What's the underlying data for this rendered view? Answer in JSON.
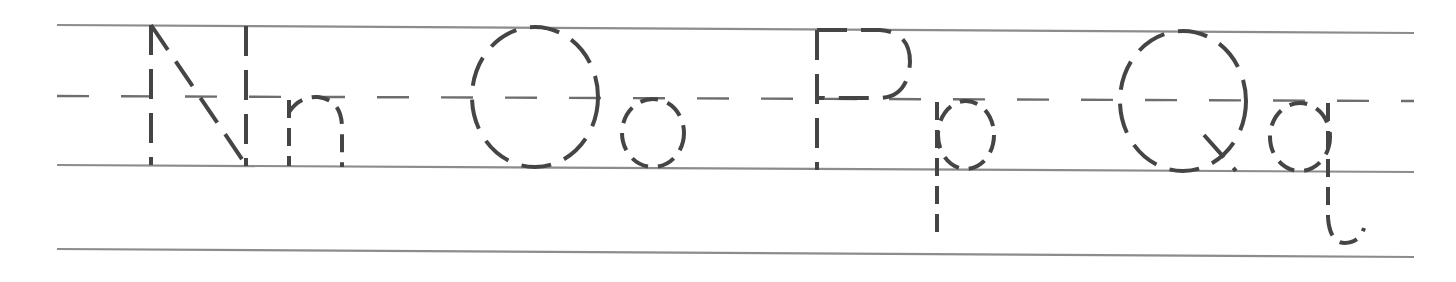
{
  "worksheet": {
    "title": "Letter tracing practice",
    "letter_pairs": [
      {
        "uppercase": "N",
        "lowercase": "n"
      },
      {
        "uppercase": "O",
        "lowercase": "o"
      },
      {
        "uppercase": "P",
        "lowercase": "p"
      },
      {
        "uppercase": "Q",
        "lowercase": "q"
      }
    ],
    "guide_lines": [
      "top-line",
      "dashed-midline",
      "baseline",
      "descender-line"
    ],
    "colors": {
      "letter_stroke": "#454545",
      "guide_line": "#8c8c8c",
      "background": "#ffffff"
    },
    "letter_style": "dashed tracing outline"
  }
}
